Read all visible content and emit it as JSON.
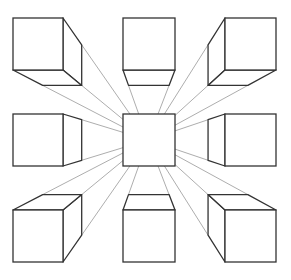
{
  "diagram": {
    "title": "",
    "type": "one-point perspective cubes",
    "vanishing_point": [
      148,
      140
    ],
    "depth_scale": 0.78,
    "colors": {
      "background": "#ffffff",
      "edge": "#333333",
      "guide": "#8a8a8a"
    },
    "cubes": [
      {
        "name": "cube-top-left",
        "front": [
          13,
          18,
          63,
          70
        ]
      },
      {
        "name": "cube-top-center",
        "front": [
          123,
          18,
          175,
          70
        ]
      },
      {
        "name": "cube-top-right",
        "front": [
          225,
          18,
          276,
          70
        ]
      },
      {
        "name": "cube-middle-left",
        "front": [
          13,
          114,
          63,
          166
        ]
      },
      {
        "name": "cube-center",
        "front": [
          123,
          114,
          175,
          166
        ]
      },
      {
        "name": "cube-middle-right",
        "front": [
          225,
          114,
          276,
          166
        ]
      },
      {
        "name": "cube-bottom-left",
        "front": [
          13,
          210,
          63,
          262
        ]
      },
      {
        "name": "cube-bottom-center",
        "front": [
          123,
          210,
          175,
          262
        ]
      },
      {
        "name": "cube-bottom-right",
        "front": [
          225,
          210,
          276,
          262
        ]
      }
    ]
  }
}
